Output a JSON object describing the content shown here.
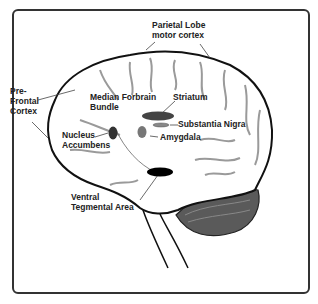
{
  "labels": {
    "parietal": "Parietal Lobe\nmotor cortex",
    "prefrontal": "Pre-\nFrontal\nCortex",
    "mfb": "Median Forbrain\nBundle",
    "striatum": "Striatum",
    "substantia_nigra": "Substantia Nigra",
    "amygdala": "Amygdala",
    "nucleus_accumbens": "Nucleus\nAccumbens",
    "vta": "Ventral\nTegmental Area"
  },
  "colors": {
    "outline": "#111111",
    "sulci": "#9a9a9a",
    "cerebellum": "#555555",
    "striatum": "#444444",
    "substantia_nigra": "#888888",
    "amygdala": "#777777",
    "nucleus_accumbens": "#333333",
    "vta": "#000000"
  }
}
